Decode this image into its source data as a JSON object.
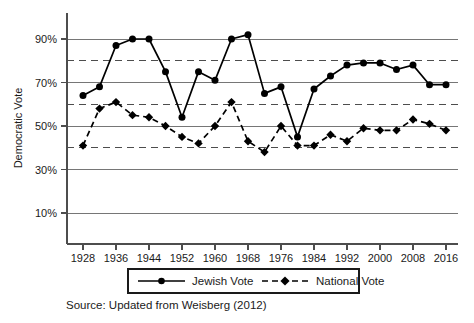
{
  "chart_data": {
    "type": "line",
    "title": "",
    "xlabel": "",
    "ylabel": "Democratic Vote",
    "x": [
      1928,
      1932,
      1936,
      1940,
      1944,
      1948,
      1952,
      1956,
      1960,
      1964,
      1968,
      1972,
      1976,
      1980,
      1984,
      1988,
      1992,
      1996,
      2000,
      2004,
      2008,
      2012,
      2016
    ],
    "xticks": [
      "1928",
      "1936",
      "1944",
      "1952",
      "1960",
      "1968",
      "1976",
      "1984",
      "1992",
      "2000",
      "2008",
      "2016"
    ],
    "xtick_values": [
      1928,
      1936,
      1944,
      1952,
      1960,
      1968,
      1976,
      1984,
      1992,
      2000,
      2008,
      2016
    ],
    "yticks": [
      "10%",
      "30%",
      "50%",
      "70%",
      "90%"
    ],
    "ytick_values": [
      10,
      30,
      50,
      70,
      90
    ],
    "ylim": [
      0,
      100
    ],
    "xlim": [
      1926,
      2018
    ],
    "grid": "horizontal solid at 10/30/50/70/90, dashed at 40/60/80",
    "grid_solid_values": [
      10,
      30,
      50,
      70,
      90
    ],
    "grid_dashed_values": [
      40,
      60,
      80
    ],
    "legend_position": "below-axis-center",
    "series": [
      {
        "name": "Jewish Vote",
        "marker": "circle",
        "line_style": "solid",
        "color": "#000000",
        "values": [
          64,
          68,
          87,
          90,
          90,
          75,
          54,
          75,
          71,
          90,
          92,
          65,
          68,
          45,
          67,
          73,
          78,
          79,
          79,
          76,
          78,
          69,
          69
        ]
      },
      {
        "name": "National Vote",
        "marker": "diamond",
        "line_style": "dashed",
        "color": "#000000",
        "values": [
          41,
          58,
          61,
          55,
          54,
          50,
          45,
          42,
          50,
          61,
          43,
          38,
          50,
          41,
          41,
          46,
          43,
          49,
          48,
          48,
          53,
          51,
          48
        ]
      }
    ],
    "source_note": "Source: Updated from Weisberg (2012)"
  },
  "axis": {
    "y_title": "Democratic Vote"
  },
  "legend": {
    "items": [
      {
        "label": "Jewish Vote",
        "style": "solid-circle"
      },
      {
        "label": "National Vote",
        "style": "dashed-diamond"
      }
    ]
  },
  "footer": {
    "source": "Source: Updated from Weisberg (2012)"
  }
}
